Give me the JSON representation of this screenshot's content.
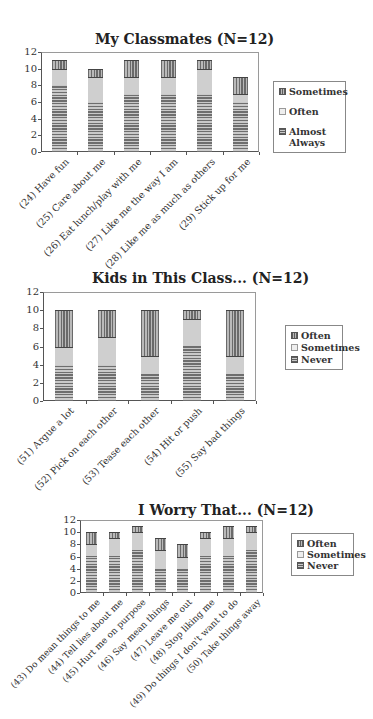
{
  "chart_data": [
    {
      "type": "bar",
      "stacked": true,
      "title": "My Classmates (N=12)",
      "xlabel": "",
      "ylabel": "",
      "ylim": [
        0,
        12
      ],
      "yticks": [
        0,
        2,
        4,
        6,
        8,
        10,
        12
      ],
      "grid": false,
      "legend_position": "right",
      "categories": [
        "(24) Have fun",
        "(25) Care about me",
        "(26) Eat lunch/play with me",
        "(27) Like me the way I am",
        "(28) Like me as much as others",
        "(29) Stick up for me"
      ],
      "series": [
        {
          "name": "Almost Always",
          "pattern": "horizontal-stripes",
          "values": [
            8,
            6,
            7,
            7,
            7,
            6
          ]
        },
        {
          "name": "Often",
          "pattern": "dotted",
          "values": [
            2,
            3,
            2,
            2,
            3,
            1
          ]
        },
        {
          "name": "Sometimes",
          "pattern": "vertical-stripes",
          "values": [
            1,
            1,
            2,
            2,
            1,
            2
          ]
        }
      ],
      "legend": [
        "Sometimes",
        "Often",
        "Almost Always"
      ]
    },
    {
      "type": "bar",
      "stacked": true,
      "title": "Kids in This Class... (N=12)",
      "xlabel": "",
      "ylabel": "",
      "ylim": [
        0,
        12
      ],
      "yticks": [
        0,
        2,
        4,
        6,
        8,
        10,
        12
      ],
      "grid": false,
      "legend_position": "right",
      "categories": [
        "(51) Argue a lot",
        "(52) Pick on each other",
        "(53) Tease each other",
        "(54) Hit or push",
        "(55) Say bad things"
      ],
      "series": [
        {
          "name": "Never",
          "pattern": "horizontal-stripes",
          "values": [
            4,
            4,
            3,
            6,
            3
          ]
        },
        {
          "name": "Sometimes",
          "pattern": "dotted",
          "values": [
            2,
            3,
            2,
            3,
            2
          ]
        },
        {
          "name": "Often",
          "pattern": "vertical-stripes",
          "values": [
            4,
            3,
            5,
            1,
            5
          ]
        }
      ],
      "legend": [
        "Often",
        "Sometimes",
        "Never"
      ]
    },
    {
      "type": "bar",
      "stacked": true,
      "title": "I Worry That... (N=12)",
      "xlabel": "",
      "ylabel": "",
      "ylim": [
        0,
        12
      ],
      "yticks": [
        0,
        2,
        4,
        6,
        8,
        10,
        12
      ],
      "grid": false,
      "legend_position": "right",
      "categories": [
        "(43) Do mean things to me",
        "(44) Tell lies about me",
        "(45) Hurt me on purpose",
        "(46) Say mean things",
        "(47) Leave me out",
        "(48) Stop liking me",
        "(49) Do things I don't want to do",
        "(50) Take things away"
      ],
      "series": [
        {
          "name": "Never",
          "pattern": "horizontal-stripes",
          "values": [
            6,
            6,
            7,
            4,
            4,
            6,
            6,
            7
          ]
        },
        {
          "name": "Sometimes",
          "pattern": "dotted",
          "values": [
            2,
            3,
            3,
            3,
            2,
            3,
            3,
            3
          ]
        },
        {
          "name": "Often",
          "pattern": "vertical-stripes",
          "values": [
            2,
            1,
            1,
            2,
            2,
            1,
            2,
            1
          ]
        }
      ],
      "legend": [
        "Often",
        "Sometimes",
        "Never"
      ]
    }
  ],
  "layout": [
    {
      "top": 0,
      "title_x": 95,
      "title_y": 31,
      "title_size": 14,
      "plot": {
        "left": 41,
        "top": 52,
        "right": 259,
        "bottom": 152
      },
      "bar_width": 15,
      "legend": {
        "left": 273,
        "top": 81,
        "width": 73,
        "height": 66,
        "gap": 9
      },
      "label_size": 9.5
    },
    {
      "top": 0,
      "title_x": 92,
      "title_y": 270,
      "title_size": 14,
      "plot": {
        "left": 43,
        "top": 292,
        "right": 256,
        "bottom": 401
      },
      "bar_width": 18,
      "legend": {
        "left": 285,
        "top": 325,
        "width": 58,
        "height": 41,
        "gap": 1
      },
      "label_size": 9.5
    },
    {
      "top": 0,
      "title_x": 138,
      "title_y": 502,
      "title_size": 14,
      "plot": {
        "left": 80,
        "top": 520,
        "right": 263,
        "bottom": 593
      },
      "bar_width": 11,
      "legend": {
        "left": 291,
        "top": 533,
        "width": 63,
        "height": 38,
        "gap": 0
      },
      "label_size": 9
    }
  ]
}
